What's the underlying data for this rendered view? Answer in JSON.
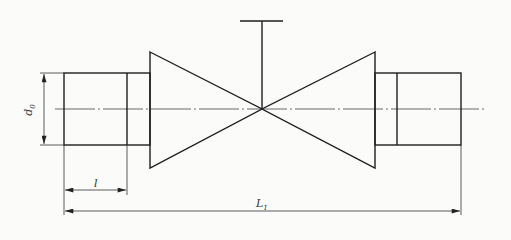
{
  "diagram": {
    "title": "",
    "type": "valve-dimension-drawing",
    "colors": {
      "line": "#1e1e1e",
      "thin": "#3a3a3a",
      "background": "#fbfbfa"
    },
    "labels": {
      "d0": {
        "main": "d",
        "sub": "0"
      },
      "l": {
        "main": "l"
      },
      "L1": {
        "main": "L",
        "sub": "1"
      }
    },
    "geometry": {
      "left_pipe": {
        "x1": 64,
        "x2": 150,
        "y1": 73,
        "y2": 145,
        "divider_x": 127
      },
      "right_pipe": {
        "x1": 375,
        "x2": 461,
        "y1": 73,
        "y2": 145,
        "divider_x": 397
      },
      "left_cone": {
        "base_x": 150,
        "top_y": 52,
        "bottom_y": 168
      },
      "right_cone": {
        "base_x": 375,
        "top_y": 52,
        "bottom_y": 168
      },
      "center": {
        "x": 262,
        "y": 109
      },
      "stem": {
        "top_y": 21,
        "bar_x1": 240,
        "bar_x2": 283
      },
      "centerline": {
        "x1": 55,
        "x2": 485,
        "y": 109
      },
      "dim_d0": {
        "x": 44,
        "y1": 73,
        "y2": 145
      },
      "dim_l": {
        "y": 190,
        "x1": 64,
        "x2": 127
      },
      "dim_L1": {
        "y": 211,
        "x1": 64,
        "x2": 461
      }
    }
  }
}
